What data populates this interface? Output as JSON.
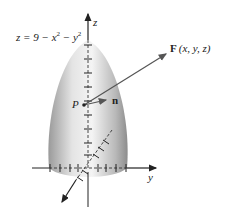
{
  "figure": {
    "equation_label": "z = 9 − x² − y²",
    "equation_parts": {
      "lhs": "z = 9 − x",
      "sup1": "2",
      "mid": " − y",
      "sup2": "2"
    },
    "axes": {
      "z_label": "z",
      "y_label": "y",
      "x_label": "x"
    },
    "vector_field_label": {
      "bold": "F",
      "args": "(x, y, z)"
    },
    "point_label": "P",
    "normal_label": "n",
    "colors": {
      "surface_light": "#f2f2f2",
      "surface_dark": "#8a8a8a",
      "axis": "#222222",
      "vector": "#555555"
    }
  }
}
